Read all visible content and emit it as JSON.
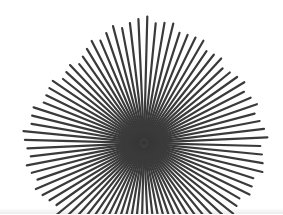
{
  "image": {
    "subject": "starburst spoke sculpture",
    "background": "#ffffff",
    "spoke_color": "#3a3a3a",
    "center": [
      144,
      143
    ],
    "spoke_count": 88,
    "spoke_width": 2.2,
    "envelope": {
      "top": 123,
      "upper_left": 105,
      "left": 118,
      "lower_left": 110,
      "bottom": 90,
      "lower_right": 112,
      "right": 120,
      "upper_right": 112
    }
  }
}
